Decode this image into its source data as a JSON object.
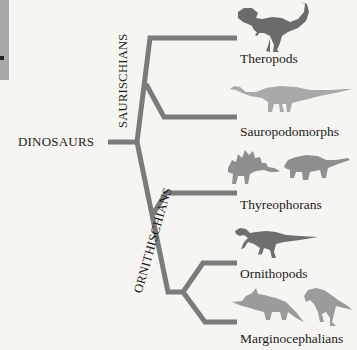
{
  "root": {
    "label": "DINOSAURS"
  },
  "clades": [
    {
      "label": "SAURISCHIANS"
    },
    {
      "label": "ORNITHISCHIANS"
    }
  ],
  "leaves": [
    {
      "label": "Theropods",
      "silhouette": "t-rex-icon",
      "color": "#6b6b6b"
    },
    {
      "label": "Sauropodomorphs",
      "silhouette": "sauropod-icon",
      "color": "#a9a9a9"
    },
    {
      "label": "Thyreophorans",
      "silhouette": "stegosaurus-ankylosaurus-icon",
      "color": "#8f8f8f"
    },
    {
      "label": "Ornithopods",
      "silhouette": "iguanodon-icon",
      "color": "#6f6f6f"
    },
    {
      "label": "Marginocephalians",
      "silhouette": "triceratops-pachycephalosaurus-icon",
      "color": "#9b9b9b"
    }
  ],
  "colors": {
    "branch": "#7b7b7b",
    "background": "#f6f5f2"
  }
}
